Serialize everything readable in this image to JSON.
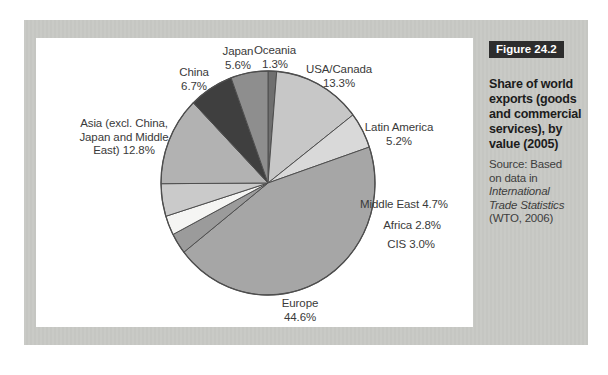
{
  "figure": {
    "tag": "Figure 24.2",
    "caption": "Share of world\nexports (goods\nand commercial\nservices), by\nvalue (2005)",
    "source_prefix": "Source: Based\non data in",
    "source_italic": "International\nTrade Statistics",
    "source_suffix": "(WTO, 2006)"
  },
  "colors": {
    "page_bg": "#ffffff",
    "panel_bg": "#c9cac6",
    "chart_bg": "#ffffff",
    "tag_bg": "#2d2d2d",
    "tag_text": "#ffffff",
    "label_text": "#3a3a3a",
    "slice_stroke": "#4e4e4e"
  },
  "chart_data": {
    "type": "pie",
    "title": "Share of world exports (goods and commercial services), by value (2005)",
    "source": "Based on data in International Trade Statistics (WTO, 2006)",
    "unit": "%",
    "start_angle_deg": 0,
    "direction": "clockwise",
    "geometry": {
      "cx": 268,
      "cy": 183,
      "rx": 107,
      "ry": 112,
      "stroke": "#4e4e4e"
    },
    "slices": [
      {
        "id": "oceania",
        "category": "Oceania",
        "value": 1.3,
        "color": "#6f6f6f",
        "label": "Oceania\n1.3%",
        "label_pos": {
          "left": 275,
          "top": 44,
          "align": "center"
        }
      },
      {
        "id": "usa-canada",
        "category": "USA/Canada",
        "value": 13.3,
        "color": "#c7c7c7",
        "label": "USA/Canada\n13.3%",
        "label_pos": {
          "left": 339,
          "top": 63,
          "align": "center"
        }
      },
      {
        "id": "latin-america",
        "category": "Latin America",
        "value": 5.2,
        "color": "#d9d9d9",
        "label": "Latin America\n5.2%",
        "label_pos": {
          "left": 399,
          "top": 121,
          "align": "center"
        }
      },
      {
        "id": "europe",
        "category": "Europe",
        "value": 44.6,
        "color": "#a6a6a6",
        "label": "Europe\n44.6%",
        "label_pos": {
          "left": 300,
          "top": 297,
          "align": "center"
        }
      },
      {
        "id": "cis",
        "category": "CIS",
        "value": 3.0,
        "color": "#9b9b9b",
        "label": "CIS 3.0%",
        "label_pos": {
          "right": 435,
          "top": 238,
          "align": "right"
        }
      },
      {
        "id": "africa",
        "category": "Africa",
        "value": 2.8,
        "color": "#f5f5f3",
        "label": "Africa 2.8%",
        "label_pos": {
          "right": 441,
          "top": 219,
          "align": "right"
        }
      },
      {
        "id": "middle-east",
        "category": "Middle East",
        "value": 4.7,
        "color": "#cacaca",
        "label": "Middle East 4.7%",
        "label_pos": {
          "right": 448,
          "top": 198,
          "align": "right"
        }
      },
      {
        "id": "asia-other",
        "category": "Asia (excl. China, Japan and Middle East)",
        "value": 12.8,
        "color": "#b2b2b2",
        "label": "Asia (excl. China,\nJapan and Middle\nEast) 12.8%",
        "label_pos": {
          "left": 124,
          "top": 117,
          "align": "center"
        }
      },
      {
        "id": "china",
        "category": "China",
        "value": 6.7,
        "color": "#3f3f3f",
        "label": "China\n6.7%",
        "label_pos": {
          "left": 194,
          "top": 66,
          "align": "center"
        }
      },
      {
        "id": "japan",
        "category": "Japan",
        "value": 5.6,
        "color": "#8e8e8e",
        "label": "Japan\n5.6%",
        "label_pos": {
          "left": 238,
          "top": 45,
          "align": "center"
        }
      }
    ]
  }
}
